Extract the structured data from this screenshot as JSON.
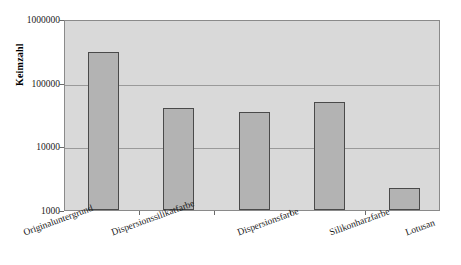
{
  "chart_data": {
    "type": "bar",
    "title": "",
    "xlabel": "",
    "ylabel": "Keimzahl",
    "yscale": "log",
    "ylim": [
      1000,
      1000000
    ],
    "grid": true,
    "legend": false,
    "categories": [
      "Originaluntergrund",
      "Dispersionssilikatfarbe",
      "Dispersionsfarbe",
      "Silikonharzfarbe",
      "Lotusan"
    ],
    "values": [
      300000,
      40000,
      34000,
      50000,
      2200
    ],
    "y_ticks": [
      "1000",
      "10000",
      "100000",
      "1000000"
    ],
    "y_tick_values": [
      1000,
      10000,
      100000,
      1000000
    ],
    "colors": {
      "bar_fill": "#b3b3b3",
      "bar_border": "#4a4a4a",
      "plot_background": "#d9d9d9",
      "gridline": "#9a9a9a",
      "frame": "#8a8a8a",
      "text": "#1a1a1a"
    }
  },
  "axis": {
    "y_title": "Keimzahl"
  }
}
